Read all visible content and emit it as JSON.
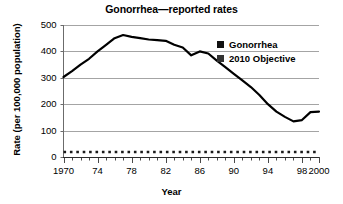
{
  "chart_data": {
    "type": "line",
    "title": "Gonorrhea—reported rates",
    "xlabel": "Year",
    "ylabel": "Rate (per 100,000 population)",
    "xlim": [
      1970,
      2000
    ],
    "ylim": [
      0,
      500
    ],
    "ytick_values": [
      0,
      100,
      200,
      300,
      400,
      500
    ],
    "ytick_labels": [
      "0",
      "100",
      "200",
      "300",
      "400",
      "500"
    ],
    "xtick_values": [
      1970,
      1974,
      1978,
      1982,
      1986,
      1990,
      1994,
      1998,
      2000
    ],
    "xtick_labels": [
      "1970",
      "74",
      "78",
      "82",
      "86",
      "90",
      "94",
      "98",
      "2000"
    ],
    "minor_xticks": "every year",
    "grid": "horizontal",
    "legend_position": "upper right",
    "series": [
      {
        "name": "Gonorrhea",
        "style": "solid",
        "color": "#000000",
        "swatch_color": "#111111",
        "x": [
          1970,
          1971,
          1972,
          1973,
          1974,
          1975,
          1976,
          1977,
          1978,
          1979,
          1980,
          1981,
          1982,
          1983,
          1984,
          1985,
          1986,
          1987,
          1988,
          1989,
          1990,
          1991,
          1992,
          1993,
          1994,
          1995,
          1996,
          1997,
          1998,
          1999,
          2000
        ],
        "values": [
          303,
          325,
          350,
          372,
          400,
          425,
          450,
          462,
          455,
          450,
          445,
          443,
          440,
          425,
          415,
          385,
          400,
          392,
          365,
          340,
          315,
          290,
          265,
          235,
          200,
          172,
          152,
          135,
          140,
          170,
          172
        ]
      },
      {
        "name": "2010 Objective",
        "style": "dotted",
        "color": "#1a1a1a",
        "swatch_color": "#333333",
        "x": [
          1970,
          2000
        ],
        "values": [
          19,
          19
        ]
      }
    ]
  },
  "legend": {
    "items": [
      {
        "label": "Gonorrhea",
        "color": "#111111"
      },
      {
        "label": "2010 Objective",
        "color": "#333333"
      }
    ]
  }
}
